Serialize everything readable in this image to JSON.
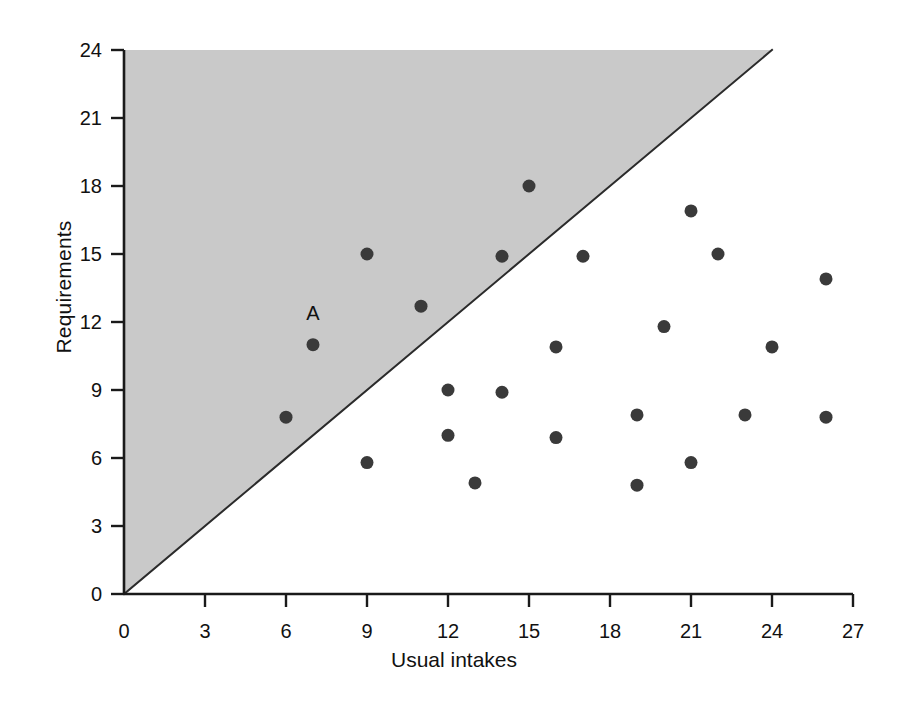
{
  "chart_data": {
    "type": "scatter",
    "title": "",
    "xlabel": "Usual intakes",
    "ylabel": "Requirements",
    "xlim": [
      0,
      27
    ],
    "ylim": [
      0,
      24
    ],
    "xticks": [
      0,
      3,
      6,
      9,
      12,
      15,
      18,
      21,
      24,
      27
    ],
    "yticks": [
      0,
      3,
      6,
      9,
      12,
      15,
      18,
      21,
      24
    ],
    "grid": false,
    "legend": null,
    "reference_line": {
      "name": "identity-line",
      "equation": "y = x",
      "from": [
        0,
        0
      ],
      "to": [
        24,
        24
      ],
      "color": "#2b2b2b"
    },
    "shaded_region": {
      "name": "requirements-exceed-intake-region",
      "description": "Shaded triangle above the y = x line where Requirements > Usual intakes",
      "color": "#c9c9c9",
      "vertices": [
        [
          0,
          0
        ],
        [
          0,
          24
        ],
        [
          24,
          24
        ]
      ]
    },
    "marker": {
      "shape": "circle",
      "color": "#3a3a3a",
      "size_px": 13
    },
    "points": [
      {
        "x": 6.0,
        "y": 7.8,
        "label": ""
      },
      {
        "x": 7.0,
        "y": 11.0,
        "label": "A"
      },
      {
        "x": 9.0,
        "y": 15.0,
        "label": ""
      },
      {
        "x": 9.0,
        "y": 5.8,
        "label": ""
      },
      {
        "x": 11.0,
        "y": 12.7,
        "label": ""
      },
      {
        "x": 12.0,
        "y": 9.0,
        "label": ""
      },
      {
        "x": 12.0,
        "y": 7.0,
        "label": ""
      },
      {
        "x": 13.0,
        "y": 4.9,
        "label": ""
      },
      {
        "x": 14.0,
        "y": 14.9,
        "label": ""
      },
      {
        "x": 14.0,
        "y": 8.9,
        "label": ""
      },
      {
        "x": 15.0,
        "y": 18.0,
        "label": ""
      },
      {
        "x": 16.0,
        "y": 10.9,
        "label": ""
      },
      {
        "x": 16.0,
        "y": 6.9,
        "label": ""
      },
      {
        "x": 17.0,
        "y": 14.9,
        "label": ""
      },
      {
        "x": 19.0,
        "y": 7.9,
        "label": ""
      },
      {
        "x": 19.0,
        "y": 4.8,
        "label": ""
      },
      {
        "x": 20.0,
        "y": 11.8,
        "label": ""
      },
      {
        "x": 21.0,
        "y": 16.9,
        "label": ""
      },
      {
        "x": 21.0,
        "y": 5.8,
        "label": ""
      },
      {
        "x": 22.0,
        "y": 15.0,
        "label": ""
      },
      {
        "x": 23.0,
        "y": 7.9,
        "label": ""
      },
      {
        "x": 24.0,
        "y": 10.9,
        "label": ""
      },
      {
        "x": 26.0,
        "y": 13.9,
        "label": ""
      },
      {
        "x": 26.0,
        "y": 7.8,
        "label": ""
      }
    ],
    "annotations": [
      {
        "name": "point-label-A",
        "text": "A",
        "x": 7.0,
        "y": 12.1
      }
    ]
  },
  "axes": {
    "x_label": "Usual intakes",
    "y_label": "Requirements"
  }
}
